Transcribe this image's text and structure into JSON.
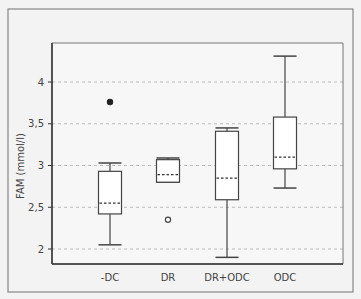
{
  "chart_data": {
    "type": "box",
    "title": "",
    "xlabel": "",
    "ylabel": "FAM (mmol/l)",
    "ylim": [
      1.8,
      4.45
    ],
    "yticks": [
      2,
      2.5,
      3,
      3.5,
      4
    ],
    "ytick_labels": [
      "2",
      "2,5",
      "3",
      "3,5",
      "4"
    ],
    "grid": "horizontal dashed",
    "legend": "none",
    "categories": [
      "-DC",
      "DR",
      "DR+ODC",
      "ODC"
    ],
    "series": [
      {
        "name": "-DC",
        "whisker_low": 2.05,
        "q1": 2.42,
        "median": 2.55,
        "q3": 2.93,
        "whisker_high": 3.03,
        "outliers": [
          {
            "value": 3.76,
            "style": "filled"
          }
        ]
      },
      {
        "name": "DR",
        "whisker_low": 2.8,
        "q1": 2.8,
        "median": 2.89,
        "q3": 3.07,
        "whisker_high": 3.09,
        "outliers": [
          {
            "value": 2.35,
            "style": "open"
          }
        ]
      },
      {
        "name": "DR+ODC",
        "whisker_low": 1.9,
        "q1": 2.59,
        "median": 2.85,
        "q3": 3.41,
        "whisker_high": 3.45,
        "outliers": []
      },
      {
        "name": "ODC",
        "whisker_low": 2.73,
        "q1": 2.96,
        "median": 3.1,
        "q3": 3.58,
        "whisker_high": 4.31,
        "outliers": []
      }
    ]
  },
  "colors": {
    "background": "#f3f3f3",
    "frame": "#777777",
    "axis": "#333333",
    "grid": "#bbbbbb",
    "box_fill": "#ffffff",
    "box_stroke": "#444444",
    "text": "#444444"
  }
}
